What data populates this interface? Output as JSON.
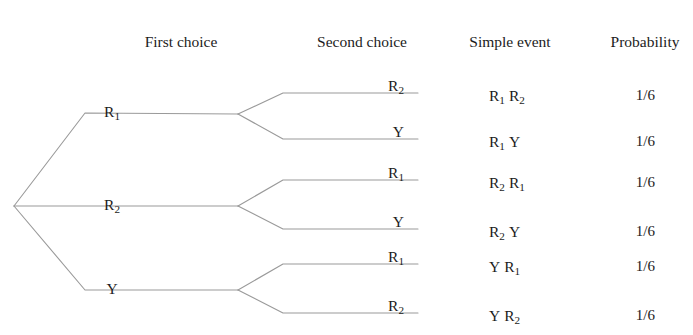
{
  "headers": [
    {
      "label": "First choice",
      "x": 181
    },
    {
      "label": "Second choice",
      "x": 362
    },
    {
      "label": "Simple event",
      "x": 510
    },
    {
      "label": "Probability",
      "x": 645
    }
  ],
  "header_y": 34,
  "colors": {
    "line": "#9a9a9a",
    "text": "#1c1c1c",
    "background": "#ffffff"
  },
  "tree": {
    "root": {
      "x": 14,
      "y": 206
    },
    "first_level": [
      {
        "id": "r1",
        "label_html": "R<sub>1</sub>",
        "label_x": 112,
        "label_y": 104,
        "node_x": 238,
        "node_y": 114,
        "bend_x": 85,
        "bend_y": 113
      },
      {
        "id": "r2",
        "label_html": "R<sub>2</sub>",
        "label_x": 112,
        "label_y": 197,
        "node_x": 238,
        "node_y": 206,
        "bend_x": 85,
        "bend_y": 206
      },
      {
        "id": "y",
        "label_html": "Y",
        "label_x": 112,
        "label_y": 281,
        "node_x": 238,
        "node_y": 290,
        "bend_x": 85,
        "bend_y": 290
      }
    ],
    "second_level": [
      {
        "id": "r1-r2",
        "parent": "r1",
        "label_html": "R<sub>2</sub>",
        "label_x": 404,
        "label_y": 78,
        "bend_x": 283,
        "bend_y": 93,
        "end_x": 418,
        "end_y": 93
      },
      {
        "id": "r1-y",
        "parent": "r1",
        "label_html": "Y",
        "label_x": 404,
        "label_y": 124,
        "bend_x": 283,
        "bend_y": 139,
        "end_x": 418,
        "end_y": 139
      },
      {
        "id": "r2-r1",
        "parent": "r2",
        "label_html": "R<sub>1</sub>",
        "label_x": 404,
        "label_y": 165,
        "bend_x": 283,
        "bend_y": 180,
        "end_x": 418,
        "end_y": 180
      },
      {
        "id": "r2-y",
        "parent": "r2",
        "label_html": "Y",
        "label_x": 404,
        "label_y": 214,
        "bend_x": 283,
        "bend_y": 229,
        "end_x": 418,
        "end_y": 229
      },
      {
        "id": "y-r1",
        "parent": "y",
        "label_html": "R<sub>1</sub>",
        "label_x": 404,
        "label_y": 249,
        "bend_x": 283,
        "bend_y": 264,
        "end_x": 418,
        "end_y": 264
      },
      {
        "id": "y-r2",
        "parent": "y",
        "label_html": "R<sub>2</sub>",
        "label_x": 404,
        "label_y": 298,
        "bend_x": 283,
        "bend_y": 313,
        "end_x": 418,
        "end_y": 313
      }
    ]
  },
  "outcomes": [
    {
      "id": "row-1",
      "event_html": "R<sub>1</sub><span class=\"sp\"></span>R<sub>2</sub>",
      "probability": "1/6",
      "x": 489,
      "y": 88
    },
    {
      "id": "row-2",
      "event_html": "R<sub>1</sub><span class=\"sp\"></span>Y",
      "probability": "1/6",
      "x": 489,
      "y": 134
    },
    {
      "id": "row-3",
      "event_html": "R<sub>2</sub><span class=\"sp\"></span>R<sub>1</sub>",
      "probability": "1/6",
      "x": 489,
      "y": 175
    },
    {
      "id": "row-4",
      "event_html": "R<sub>2</sub><span class=\"sp\"></span>Y",
      "probability": "1/6",
      "x": 489,
      "y": 224
    },
    {
      "id": "row-5",
      "event_html": "Y<span class=\"sp\"></span>R<sub>1</sub>",
      "probability": "1/6",
      "x": 489,
      "y": 259
    },
    {
      "id": "row-6",
      "event_html": "Y<span class=\"sp\"></span>R<sub>2</sub>",
      "probability": "1/6",
      "x": 489,
      "y": 308
    }
  ],
  "probability_x": 655
}
